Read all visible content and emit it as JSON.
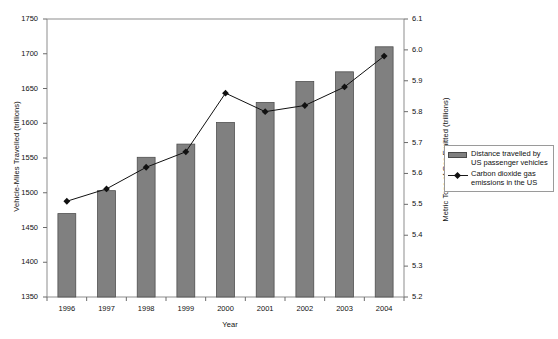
{
  "chart_data": {
    "type": "bar",
    "title": "",
    "xlabel": "Year",
    "ylabel": "Vehicle-Miles Travelled (trillions)",
    "y2label": "Metric Tons of Gas Emitted (trillions)",
    "categories": [
      "1996",
      "1997",
      "1998",
      "1999",
      "2000",
      "2001",
      "2002",
      "2003",
      "2004"
    ],
    "ylim": [
      1350,
      1750
    ],
    "yticks": [
      "1350",
      "1400",
      "1450",
      "1500",
      "1550",
      "1600",
      "1650",
      "1700",
      "1750"
    ],
    "y2lim": [
      5.2,
      6.1
    ],
    "y2ticks": [
      "5.2",
      "5.3",
      "5.4",
      "5.5",
      "5.6",
      "5.7",
      "5.8",
      "5.9",
      "6.0",
      "6.1"
    ],
    "grid": false,
    "legend_position": "right",
    "series": [
      {
        "name": "Distance travelled by US passenger vehicles",
        "render": "bar",
        "axis": "left",
        "color": "#808080",
        "values": [
          1470,
          1503,
          1551,
          1570,
          1601,
          1630,
          1660,
          1674,
          1710
        ]
      },
      {
        "name": "Carbon dioxide gas emissions in the US",
        "render": "line",
        "axis": "right",
        "color": "#111111",
        "values": [
          5.51,
          5.55,
          5.62,
          5.67,
          5.86,
          5.8,
          5.82,
          5.88,
          5.98
        ]
      }
    ]
  },
  "legend": {
    "items": [
      {
        "key": "bar-swatch",
        "line1": "Distance travelled by",
        "line2": "US passenger vehicles"
      },
      {
        "key": "line-marker",
        "line1": "Carbon dioxide gas",
        "line2": "emissions in the US"
      }
    ]
  }
}
